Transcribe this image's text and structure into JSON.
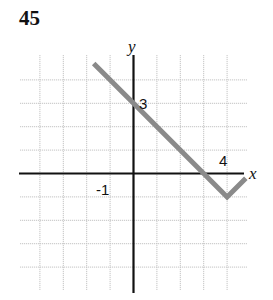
{
  "figure": {
    "number": "45"
  },
  "chart_data": {
    "type": "line",
    "title": "45",
    "xlabel": "x",
    "ylabel": "y",
    "grid": true,
    "xlim": [
      -5,
      5
    ],
    "ylim": [
      -5,
      5
    ],
    "grid_step": 1,
    "tick_labels": [
      {
        "axis": "x",
        "value": -1,
        "label": "-1"
      },
      {
        "axis": "x",
        "value": 4,
        "label": "4"
      },
      {
        "axis": "y",
        "value": 3,
        "label": "3"
      }
    ],
    "series": [
      {
        "name": "piecewise-linear",
        "color": "#8a8a8a",
        "points": [
          [
            -1.7,
            4.7
          ],
          [
            0,
            3
          ],
          [
            3,
            0
          ],
          [
            4,
            -1
          ],
          [
            4.8,
            -0.2
          ]
        ]
      }
    ],
    "annotations": [
      "y-intercept 3",
      "x-intercept 3",
      "vertex at (4, -1)"
    ]
  },
  "labels": {
    "x_axis": "x",
    "y_axis": "y",
    "tick_neg1": "-1",
    "tick_4": "4",
    "tick_3": "3"
  },
  "colors": {
    "curve": "#8a8a8a",
    "axis": "#111111",
    "grid": "#c4c4c4"
  }
}
